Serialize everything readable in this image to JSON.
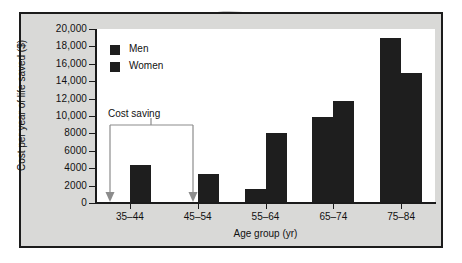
{
  "chart_data": {
    "type": "bar",
    "title": "",
    "xlabel": "Age group (yr)",
    "ylabel": "Cost per year of life saved ($)",
    "categories": [
      "35–44",
      "45–54",
      "55–64",
      "65–74",
      "75–84"
    ],
    "series": [
      {
        "name": "Men",
        "values": [
          null,
          null,
          1600,
          9900,
          19000
        ]
      },
      {
        "name": "Women",
        "values": [
          4400,
          3300,
          8000,
          11700,
          14900
        ]
      }
    ],
    "ylim": [
      0,
      20000
    ],
    "ytick_values": [
      0,
      2000,
      4000,
      6000,
      8000,
      10000,
      12000,
      14000,
      16000,
      18000,
      20000
    ],
    "ytick_labels": [
      "0",
      "2000",
      "4000",
      "6000",
      "8000",
      "10,000",
      "12,000",
      "14,000",
      "16,000",
      "18,000",
      "20,000"
    ],
    "grid": false,
    "legend_position": "top-left",
    "bar_color": "#1e1e1e",
    "annotations": [
      {
        "label": "Cost saving",
        "type": "bracket-with-arrows",
        "spans": [
          "35–44",
          "45–54"
        ],
        "color": "#8c8c8c"
      }
    ]
  },
  "legend": {
    "items": [
      {
        "label": "Men",
        "color": "#1e1e1e"
      },
      {
        "label": "Women",
        "color": "#1e1e1e"
      }
    ]
  },
  "annotation": {
    "cost_saving_label": "Cost saving"
  },
  "axes": {
    "y_title": "Cost per year of life saved ($)",
    "x_title": "Age group (yr)",
    "y_labels": [
      "20,000",
      "18,000",
      "16,000",
      "14,000",
      "12,000",
      "10,000",
      "8000",
      "6000",
      "4000",
      "2000",
      "0"
    ],
    "x_labels": [
      "35–44",
      "45–54",
      "55–64",
      "65–74",
      "75–84"
    ]
  },
  "colors": {
    "bar": "#1e1e1e",
    "panel_background": "#d9d9d7",
    "plot_background": "#ffffff",
    "frame": "#1c1c1c",
    "annotation": "#8c8c8c"
  }
}
